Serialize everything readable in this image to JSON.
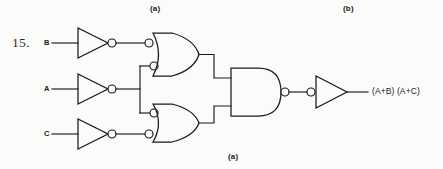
{
  "figure": {
    "item_number": "15.",
    "top_label_a": "(a)",
    "top_label_b": "(b)",
    "bottom_label_a": "(a)",
    "background_color": "#fbfbfa",
    "ink_color": "#1a1a1a"
  },
  "inputs": [
    {
      "label": "B",
      "name": "input-b"
    },
    {
      "label": "A",
      "name": "input-a"
    },
    {
      "label": "C",
      "name": "input-c"
    }
  ],
  "output": {
    "expression": "(A+B)  (A+C)"
  },
  "gates": [
    {
      "name": "inverter-b",
      "type": "inverter",
      "bubble": "output"
    },
    {
      "name": "inverter-a",
      "type": "inverter",
      "bubble": "output"
    },
    {
      "name": "inverter-c",
      "type": "inverter",
      "bubble": "output"
    },
    {
      "name": "or-gate-top",
      "type": "or",
      "bubble": "inputs"
    },
    {
      "name": "or-gate-bottom",
      "type": "or",
      "bubble": "inputs"
    },
    {
      "name": "and-gate",
      "type": "and",
      "bubble": "output"
    },
    {
      "name": "output-inverter",
      "type": "inverter",
      "bubble": "input"
    }
  ]
}
